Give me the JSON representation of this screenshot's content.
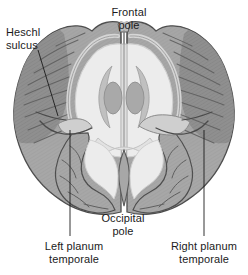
{
  "figure": {
    "kind": "anatomical-diagram",
    "background_color": "#ffffff"
  },
  "palette": {
    "outline": "#4d4d4d",
    "cortex_gray": "#a7a7a7",
    "cortex_gray_dark": "#8e8e8e",
    "cortex_gray_light": "#bdbdbd",
    "white_matter": "#ececec",
    "white_matter_edge": "#dcdcdc",
    "ventricle": "#c9c9c9",
    "nucleus": "#a9a9a9",
    "leader_line": "#1b1b1b",
    "text": "#1b1b1b"
  },
  "labels": {
    "heschl_sulcus": "Heschl\nsulcus",
    "frontal_pole": "Frontal\npole",
    "occipital_pole": "Occipital\npole",
    "left_planum_temporale": "Left planum\ntemporale",
    "right_planum_temporale": "Right planum\ntemporale"
  },
  "leader_lines": [
    {
      "name": "heschl-sulcus-leader",
      "x1": 38,
      "y1": 50,
      "x2": 58,
      "y2": 116
    },
    {
      "name": "left-planum-temporale-leader",
      "x1": 70,
      "y1": 130,
      "x2": 70,
      "y2": 236
    },
    {
      "name": "right-planum-temporale-leader",
      "x1": 204,
      "y1": 130,
      "x2": 204,
      "y2": 236
    }
  ]
}
